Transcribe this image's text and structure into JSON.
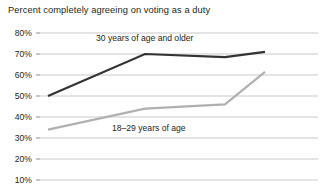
{
  "chart_data": {
    "type": "line",
    "title": "Percent completely agreeing on voting as a duty",
    "xlabel": "",
    "ylabel": "",
    "ylim": [
      10,
      80
    ],
    "yticks": [
      80,
      70,
      60,
      50,
      40,
      30,
      20,
      10
    ],
    "ytick_labels": [
      "80%",
      "70%",
      "60%",
      "50%",
      "40%",
      "30%",
      "20%",
      "10%"
    ],
    "grid": true,
    "legend_position": "inline-annotation",
    "x": [
      0,
      1,
      2,
      3
    ],
    "series": [
      {
        "name": "30 years of age and older",
        "color": "#333333",
        "values": [
          50,
          70,
          68.5,
          71
        ]
      },
      {
        "name": "18–29 years of age",
        "color": "#b0b0b0",
        "values": [
          34,
          44,
          46,
          61.5
        ]
      }
    ],
    "annotations": [
      {
        "text": "30 years of age and older",
        "series": "30 years of age and older"
      },
      {
        "text": "18–29 years of age",
        "series": "18–29 years of age"
      }
    ]
  },
  "colors": {
    "gridline": "#c9c9c9",
    "text": "#231f20",
    "background": "#ffffff"
  }
}
